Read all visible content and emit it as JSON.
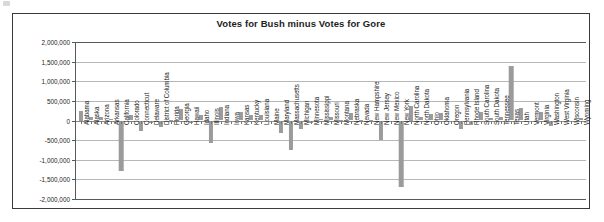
{
  "chart": {
    "title": "Votes for Bush minus Votes for Gore",
    "bar_color": "#9b9b9b",
    "frame_color": "#3a3a3a",
    "grid_color": "#b7b7b7"
  },
  "chart_data": {
    "type": "bar",
    "title": "Votes for Bush minus Votes for Gore",
    "xlabel": "",
    "ylabel": "",
    "ylim": [
      -2000000,
      2000000
    ],
    "ytick_labels": [
      "2,000,000",
      "1,500,000",
      "1,000,000",
      "500,000",
      "0",
      "-500,000",
      "-1,000,000",
      "-1,500,000",
      "-2,000,000"
    ],
    "ytick_values": [
      2000000,
      1500000,
      1000000,
      500000,
      0,
      -500000,
      -1000000,
      -1500000,
      -2000000
    ],
    "grid": true,
    "legend": false,
    "categories": [
      "Alabama",
      "Alaska",
      "Arizona",
      "Arkansas",
      "California",
      "Colorado",
      "Connecticut",
      "Delaware",
      "District of Columbia",
      "Florida",
      "Georgia",
      "Hawaii",
      "Idaho",
      "Illinois",
      "Indiana",
      "Iowa",
      "Kansas",
      "Kentucky",
      "Louisiana",
      "Maine",
      "Maryland",
      "Massachusetts",
      "Michigan",
      "Minnesota",
      "Mississippi",
      "Missouri",
      "Montana",
      "Nebraska",
      "Nevada",
      "New Hampshire",
      "New Jersey",
      "New Mexico",
      "New York",
      "North Carolina",
      "North Dakota",
      "Ohio",
      "Oklahoma",
      "Oregon",
      "Pennsylvania",
      "Rhode Island",
      "South Carolina",
      "South Dakota",
      "Tennessee",
      "Texas",
      "Utah",
      "Vermont",
      "Virginia",
      "Washington",
      "West Virginia",
      "Wisconsin",
      "Wyoming"
    ],
    "values": [
      250000,
      88000,
      96000,
      50000,
      -1290000,
      145000,
      -255000,
      -57000,
      -172000,
      540,
      305000,
      -68000,
      138000,
      -570000,
      335000,
      -4000,
      220000,
      145000,
      135000,
      -34000,
      -330000,
      -750000,
      -220000,
      -59000,
      50000,
      79000,
      25000,
      200000,
      21000,
      7000,
      -505000,
      -4000,
      -1700000,
      375000,
      79000,
      165000,
      190000,
      -6000,
      -205000,
      -120000,
      215000,
      70000,
      80000,
      1400000,
      312000,
      -22000,
      220000,
      -138000,
      -41000,
      -5000,
      57000
    ]
  }
}
